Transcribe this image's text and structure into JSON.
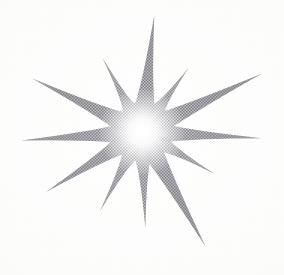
{
  "image": {
    "kind": "scanned-halftone-illustration",
    "subject": "starburst",
    "title": "Twelve-point halftone starburst",
    "width": 284,
    "height": 275,
    "background_color": "#fcfcfb",
    "ink_color": "#3f4049",
    "ink_color_light": "#8d8f99",
    "core_color": "#fbfbfa",
    "texture": "halftone-dot-screen",
    "point_count": 12
  },
  "star": {
    "center": {
      "x": 142,
      "y": 132
    },
    "core_radius": 17,
    "glow_radius": 44,
    "rays": [
      {
        "name": "ray-north",
        "angle_deg": -84,
        "length": 117,
        "half_width_deg": 3.6,
        "darkness": 1.0
      },
      {
        "name": "ray-north-northeast",
        "angle_deg": -54,
        "length": 79,
        "half_width_deg": 2.9,
        "darkness": 0.92
      },
      {
        "name": "ray-northeast",
        "angle_deg": -26,
        "length": 133,
        "half_width_deg": 3.3,
        "darkness": 1.0
      },
      {
        "name": "ray-east",
        "angle_deg": 3,
        "length": 119,
        "half_width_deg": 3.0,
        "darkness": 0.96
      },
      {
        "name": "ray-east-southeast",
        "angle_deg": 30,
        "length": 84,
        "half_width_deg": 2.8,
        "darkness": 0.9
      },
      {
        "name": "ray-southeast",
        "angle_deg": 61,
        "length": 131,
        "half_width_deg": 3.4,
        "darkness": 1.0
      },
      {
        "name": "ray-south",
        "angle_deg": 88,
        "length": 96,
        "half_width_deg": 2.9,
        "darkness": 0.94
      },
      {
        "name": "ray-south-southwest",
        "angle_deg": 118,
        "length": 90,
        "half_width_deg": 2.9,
        "darkness": 0.92
      },
      {
        "name": "ray-southwest",
        "angle_deg": 148,
        "length": 113,
        "half_width_deg": 3.2,
        "darkness": 0.98
      },
      {
        "name": "ray-west",
        "angle_deg": 176,
        "length": 121,
        "half_width_deg": 3.1,
        "darkness": 0.96
      },
      {
        "name": "ray-west-northwest",
        "angle_deg": 206,
        "length": 122,
        "half_width_deg": 3.3,
        "darkness": 1.0
      },
      {
        "name": "ray-north-northwest",
        "angle_deg": 242,
        "length": 84,
        "half_width_deg": 2.7,
        "darkness": 0.9
      }
    ]
  },
  "halftone": {
    "cell_size": 3,
    "pattern": "checkerboard-dot",
    "dot_color": "#3f4049"
  }
}
